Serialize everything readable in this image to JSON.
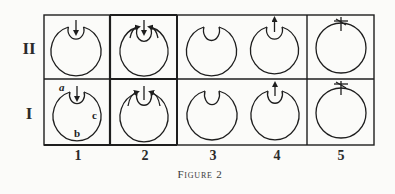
{
  "figure": {
    "caption": "Figure 2",
    "rows": [
      {
        "label": "II",
        "key": "II"
      },
      {
        "label": "I",
        "key": "I"
      }
    ],
    "columns": [
      {
        "label": "1"
      },
      {
        "label": "2"
      },
      {
        "label": "3"
      },
      {
        "label": "4"
      },
      {
        "label": "5"
      }
    ],
    "cell_annotations": {
      "row_I_col_1": [
        "a",
        "b",
        "c"
      ]
    },
    "cells": [
      {
        "row": "II",
        "col": "1",
        "icon": "circle-with-inner-loop-down-arrow"
      },
      {
        "row": "II",
        "col": "2",
        "icon": "circle-with-inner-loop-down-arrow-converging-arrows"
      },
      {
        "row": "II",
        "col": "3",
        "icon": "circle-with-inner-loop"
      },
      {
        "row": "II",
        "col": "4",
        "icon": "circle-with-inner-loop-up-arrow"
      },
      {
        "row": "II",
        "col": "5",
        "icon": "circle-with-cross-mark"
      },
      {
        "row": "I",
        "col": "1",
        "icon": "circle-with-inner-loop-down-arrow-labeled-abc"
      },
      {
        "row": "I",
        "col": "2",
        "icon": "circle-with-inner-loop-up-stroke-converging-arrows"
      },
      {
        "row": "I",
        "col": "3",
        "icon": "circle-with-inner-loop"
      },
      {
        "row": "I",
        "col": "4",
        "icon": "circle-with-inner-loop-up-arrow"
      },
      {
        "row": "I",
        "col": "5",
        "icon": "circle-with-cross-mark"
      }
    ],
    "line_color": "#1e1e1e",
    "background": "#fbfbf9"
  }
}
